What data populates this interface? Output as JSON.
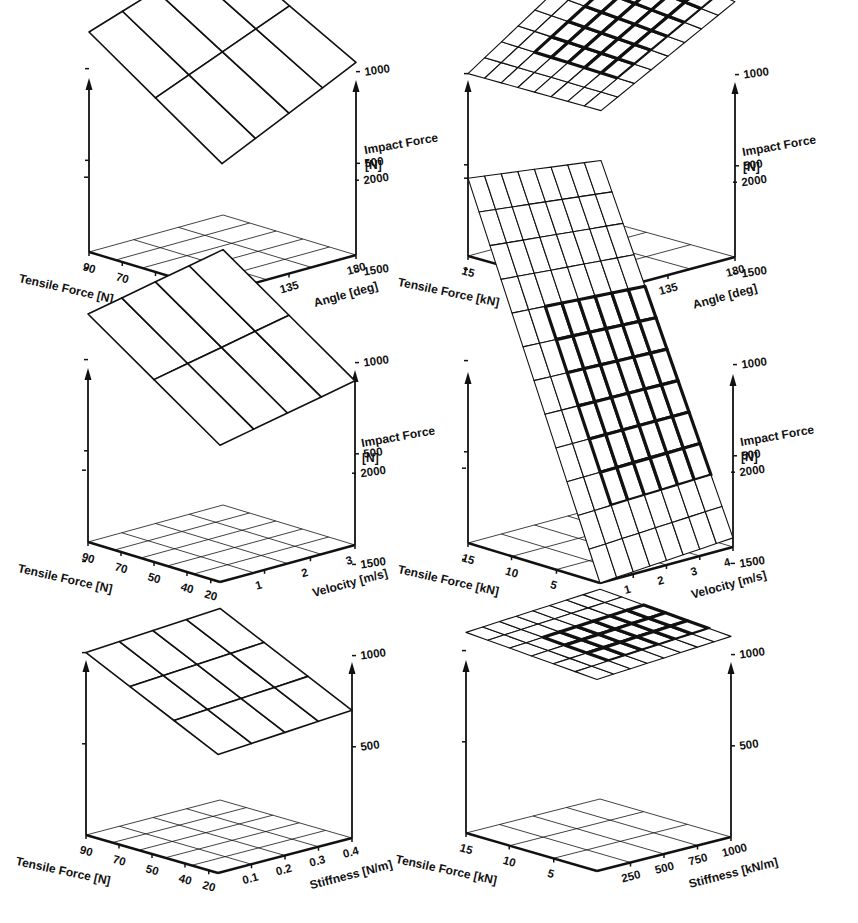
{
  "chart_data": [
    {
      "id": "panel-1",
      "type": "surface3d",
      "position": "top-left",
      "zlabel": "Impact Force [N]",
      "z_ticks": [
        "2000",
        "1500",
        "1000",
        "500"
      ],
      "xlabel": "Tensile Force [N]",
      "x_ticks": [
        "90",
        "70",
        "50",
        "40",
        "20"
      ],
      "ylabel": "Angle [deg]",
      "y_ticks": [
        "135",
        "180"
      ],
      "zlim": [
        0,
        2000
      ],
      "grid_rows": 2,
      "grid_cols": 4,
      "surface_z_corners": {
        "back_left": 1200,
        "back_right": 1450,
        "front_left": 700,
        "front_right": 1050
      },
      "highlight": false
    },
    {
      "id": "panel-2",
      "type": "surface3d",
      "position": "top-right",
      "zlabel": "Impact Force [N]",
      "z_ticks": [
        "2000",
        "1500",
        "1000",
        "500"
      ],
      "xlabel": "Tensile Force [kN]",
      "x_ticks": [
        "15",
        "10",
        "5"
      ],
      "ylabel": "Angle [deg]",
      "y_ticks": [
        "135",
        "180"
      ],
      "zlim": [
        0,
        2000
      ],
      "grid_rows": 8,
      "grid_cols": 8,
      "surface_z_corners": {
        "back_left": 1000,
        "back_right": 1500,
        "front_left": 1000,
        "front_right": 1400
      },
      "highlight": true
    },
    {
      "id": "panel-3",
      "type": "surface3d",
      "position": "middle-left",
      "zlabel": "Impact Force [N]",
      "z_ticks": [
        "2000",
        "1500",
        "1000",
        "500"
      ],
      "xlabel": "Tensile Force [N]",
      "x_ticks": [
        "90",
        "70",
        "50",
        "40",
        "20"
      ],
      "ylabel": "Velocity [m/s]",
      "y_ticks": [
        "1",
        "2",
        "3"
      ],
      "zlim": [
        0,
        2000
      ],
      "grid_rows": 2,
      "grid_cols": 4,
      "surface_z_corners": {
        "back_left": 1250,
        "back_right": 1400,
        "front_left": 750,
        "front_right": 900
      },
      "highlight": false
    },
    {
      "id": "panel-4",
      "type": "surface3d",
      "position": "middle-right",
      "zlabel": "Impact Force [N]",
      "z_ticks": [
        "2000",
        "1500",
        "1000",
        "500"
      ],
      "xlabel": "Tensile Force [kN]",
      "x_ticks": [
        "15",
        "10",
        "5"
      ],
      "ylabel": "Velocity [m/s]",
      "y_ticks": [
        "1",
        "2",
        "3",
        "4"
      ],
      "zlim": [
        0,
        2000
      ],
      "grid_rows": 12,
      "grid_cols": 8,
      "surface_z_corners": {
        "back_left": 2000,
        "back_right": 1900,
        "front_left": 0,
        "front_right": 50
      },
      "highlight": true
    },
    {
      "id": "panel-5",
      "type": "surface3d",
      "position": "bottom-left",
      "zlabel": "Impact Force [N]",
      "z_ticks": [
        "2000",
        "1500",
        "1000",
        "500"
      ],
      "xlabel": "Tensile Force [N]",
      "x_ticks": [
        "90",
        "70",
        "50",
        "40",
        "20"
      ],
      "ylabel": "Stiffness [N/m]",
      "y_ticks": [
        "0.1",
        "0.2",
        "0.3",
        "0.4"
      ],
      "zlim": [
        0,
        2000
      ],
      "grid_rows": 3,
      "grid_cols": 4,
      "surface_z_corners": {
        "back_left": 1000,
        "back_right": 1050,
        "front_left": 650,
        "front_right": 700
      },
      "highlight": false
    },
    {
      "id": "panel-6",
      "type": "surface3d",
      "position": "bottom-right",
      "zlabel": "Impact Force [N]",
      "z_ticks": [
        "2000",
        "1500",
        "1000",
        "500"
      ],
      "xlabel": "Tensile Force [kN]",
      "x_ticks": [
        "15",
        "10",
        "5"
      ],
      "ylabel": "Stiffness [kN/m]",
      "y_ticks": [
        "250",
        "500",
        "750",
        "1000"
      ],
      "zlim": [
        0,
        2000
      ],
      "grid_rows": 6,
      "grid_cols": 8,
      "surface_z_corners": {
        "back_left": 1100,
        "back_right": 1150,
        "front_left": 1050,
        "front_right": 1100
      },
      "highlight": true
    }
  ],
  "panels_geometry": [
    {
      "left": [
        89,
        252
      ],
      "front": [
        222,
        292
      ],
      "right": [
        356,
        255
      ],
      "top": 78,
      "zscale": 0.0764,
      "grid": {
        "x": 5,
        "y": 3
      },
      "x_tick_pos": [
        0,
        0.25,
        0.5,
        0.75,
        0.93
      ],
      "y_tick_pos": [
        0.5,
        1.0
      ]
    },
    {
      "left": [
        468,
        256
      ],
      "front": [
        601,
        293
      ],
      "right": [
        735,
        257
      ],
      "top": 80,
      "zscale": 0.076,
      "grid": {
        "x": 3,
        "y": 3
      },
      "x_tick_pos": [
        0,
        0.33,
        0.67
      ],
      "y_tick_pos": [
        0.5,
        1.0
      ]
    },
    {
      "left": [
        88,
        542
      ],
      "front": [
        220,
        582
      ],
      "right": [
        355,
        545
      ],
      "top": 368,
      "zscale": 0.076,
      "grid": {
        "x": 5,
        "y": 4
      },
      "x_tick_pos": [
        0,
        0.25,
        0.5,
        0.75,
        0.93
      ],
      "y_tick_pos": [
        0.33,
        0.67,
        1.0
      ]
    },
    {
      "left": [
        468,
        543
      ],
      "front": [
        600,
        583
      ],
      "right": [
        733,
        547
      ],
      "top": 372,
      "zscale": 0.076,
      "grid": {
        "x": 3,
        "y": 4
      },
      "x_tick_pos": [
        0,
        0.33,
        0.67
      ],
      "y_tick_pos": [
        0.25,
        0.5,
        0.75,
        1.0
      ]
    },
    {
      "left": [
        86,
        835
      ],
      "front": [
        218,
        873
      ],
      "right": [
        352,
        838
      ],
      "top": 660,
      "zscale": 0.076,
      "grid": {
        "x": 5,
        "y": 4
      },
      "x_tick_pos": [
        0,
        0.25,
        0.5,
        0.75,
        0.93
      ],
      "y_tick_pos": [
        0.25,
        0.5,
        0.75,
        1.0
      ]
    },
    {
      "left": [
        466,
        833
      ],
      "front": [
        597,
        871
      ],
      "right": [
        731,
        837
      ],
      "top": 660,
      "zscale": 0.076,
      "grid": {
        "x": 3,
        "y": 4
      },
      "x_tick_pos": [
        0,
        0.33,
        0.67
      ],
      "y_tick_pos": [
        0.25,
        0.5,
        0.75,
        1.0
      ]
    }
  ],
  "style": {
    "line_color": "#111111",
    "background": "#ffffff"
  }
}
